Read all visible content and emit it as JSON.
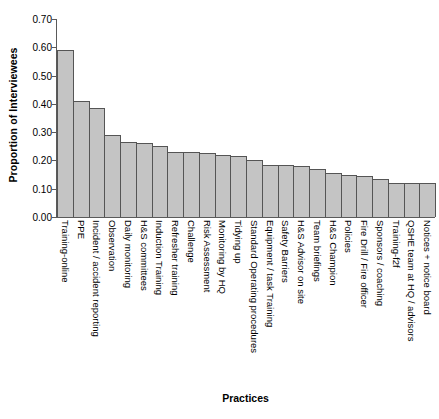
{
  "chart_data": {
    "type": "bar",
    "title": "",
    "xlabel": "Practices",
    "ylabel": "Proportion of Interviewees",
    "ylim": [
      0.0,
      0.7
    ],
    "ytick_labels": [
      "0.00",
      "0.10",
      "0.20",
      "0.30",
      "0.40",
      "0.50",
      "0.60",
      "0.70"
    ],
    "ytick_values": [
      0.0,
      0.1,
      0.2,
      0.3,
      0.4,
      0.5,
      0.6,
      0.7
    ],
    "grid": false,
    "legend": "none",
    "bar_color": "#c4c4c4",
    "bar_edge_color": "#555555",
    "categories": [
      "Training-online",
      "PPE",
      "Incident / accident reporting",
      "Observation",
      "Daily monitoring",
      "H&S committees",
      "Induction Training",
      "Refresher training",
      "Challenge",
      "Risk Assessment",
      "Monitoring by HQ",
      "Tidying up",
      "Standard Operating procedures",
      "Equipment / task Training",
      "Safety Barriers",
      "H&S Advisor on site",
      "Team briefings",
      "H&S Champion",
      "Policies",
      "Fire Drill / Fire officer",
      "Sponsors / coaching",
      "Training-f2f",
      "QSHE team at HQ / advisors",
      "Notices + notice board"
    ],
    "values": [
      0.59,
      0.41,
      0.385,
      0.29,
      0.265,
      0.26,
      0.25,
      0.23,
      0.23,
      0.225,
      0.22,
      0.215,
      0.2,
      0.185,
      0.185,
      0.18,
      0.17,
      0.155,
      0.15,
      0.145,
      0.135,
      0.12,
      0.12,
      0.12
    ]
  }
}
